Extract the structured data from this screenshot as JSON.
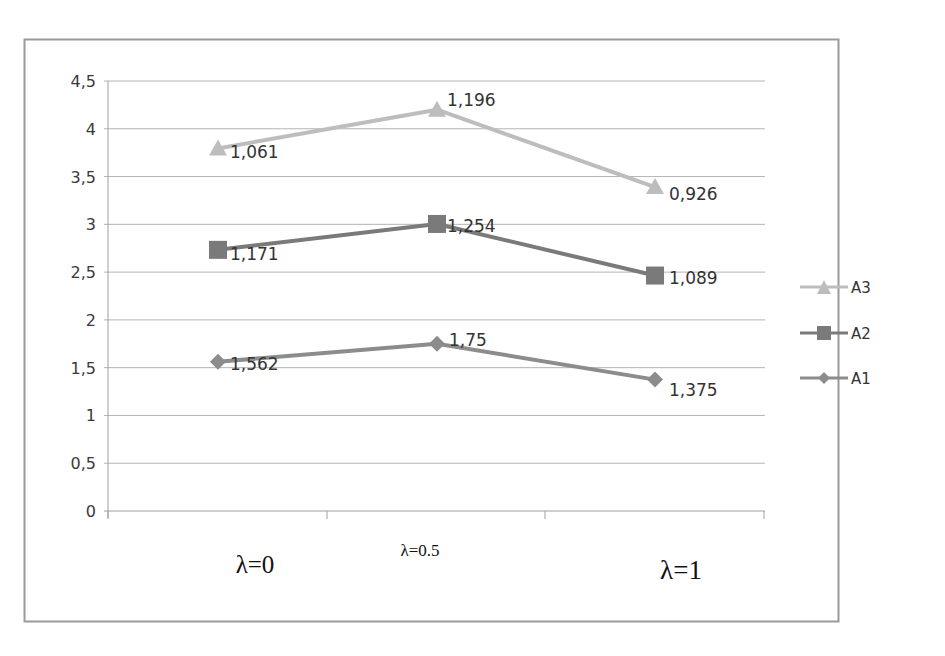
{
  "chart_data": {
    "type": "line",
    "stacked": true,
    "title": "",
    "xlabel": "",
    "ylabel": "",
    "categories": [
      "λ=0",
      "λ=0.5",
      "λ=1"
    ],
    "ylim": [
      0,
      4.5
    ],
    "yticks": [
      "0",
      "0,5",
      "1",
      "1,5",
      "2",
      "2,5",
      "3",
      "3,5",
      "4",
      "4,5"
    ],
    "grid": true,
    "legend_position": "right",
    "series": [
      {
        "name": "A1",
        "marker": "diamond",
        "color": "#8c8c8c",
        "values": [
          1.562,
          1.75,
          1.375
        ],
        "labels": [
          "1,562",
          "1,75",
          "1,375"
        ],
        "cumulative": [
          1.562,
          1.75,
          1.375
        ]
      },
      {
        "name": "A2",
        "marker": "square",
        "color": "#7a7a7a",
        "values": [
          1.171,
          1.254,
          1.089
        ],
        "labels": [
          "1,171",
          "1,254",
          "1,089"
        ],
        "cumulative": [
          2.733,
          3.004,
          2.464
        ]
      },
      {
        "name": "A3",
        "marker": "triangle",
        "color": "#bdbdbd",
        "values": [
          1.061,
          1.196,
          0.926
        ],
        "labels": [
          "1,061",
          "1,196",
          "0,926"
        ],
        "cumulative": [
          3.794,
          4.2,
          3.39
        ]
      }
    ]
  },
  "legend": {
    "items": [
      {
        "label": "A3"
      },
      {
        "label": "A2"
      },
      {
        "label": "A1"
      }
    ]
  },
  "axis": {
    "x_labels": [
      "λ=0",
      "λ=0.5",
      "λ=1"
    ]
  }
}
